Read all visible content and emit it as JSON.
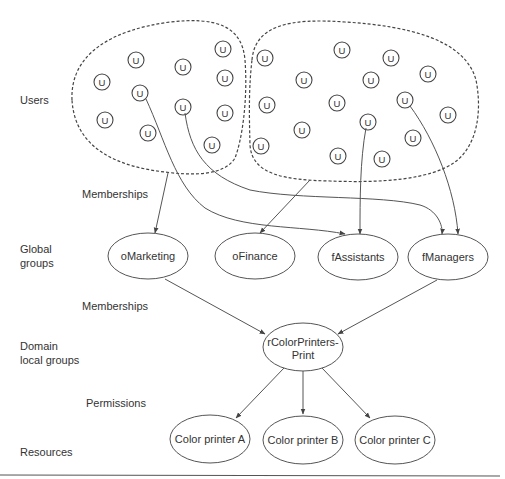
{
  "tiers": {
    "users": "Users",
    "memberships_1": "Memberships",
    "global_groups_line1": "Global",
    "global_groups_line2": "groups",
    "memberships_2": "Memberships",
    "domain_local_line1": "Domain",
    "domain_local_line2": "local groups",
    "permissions": "Permissions",
    "resources": "Resources"
  },
  "user_glyph": "U",
  "user_groups": [
    {
      "name": "left-user-set",
      "users": [
        [
          223,
          49
        ],
        [
          136,
          60
        ],
        [
          183,
          67
        ],
        [
          102,
          82
        ],
        [
          225,
          78
        ],
        [
          140,
          93
        ],
        [
          183,
          107
        ],
        [
          105,
          120
        ],
        [
          225,
          113
        ],
        [
          148,
          133
        ],
        [
          212,
          145
        ]
      ]
    },
    {
      "name": "right-user-set",
      "users": [
        [
          265,
          58
        ],
        [
          342,
          50
        ],
        [
          391,
          58
        ],
        [
          428,
          74
        ],
        [
          304,
          80
        ],
        [
          371,
          80
        ],
        [
          267,
          105
        ],
        [
          337,
          103
        ],
        [
          405,
          100
        ],
        [
          448,
          115
        ],
        [
          368,
          122
        ],
        [
          302,
          130
        ],
        [
          413,
          138
        ],
        [
          261,
          146
        ],
        [
          338,
          156
        ],
        [
          382,
          159
        ]
      ]
    }
  ],
  "global_groups": [
    {
      "id": "oMarketing",
      "label": "oMarketing"
    },
    {
      "id": "oFinance",
      "label": "oFinance"
    },
    {
      "id": "fAssistants",
      "label": "fAssistants"
    },
    {
      "id": "fManagers",
      "label": "fManagers"
    }
  ],
  "domain_local_group": {
    "line1": "rColorPrinters-",
    "line2": "Print"
  },
  "resources": [
    {
      "id": "printer-a",
      "label": "Color printer A"
    },
    {
      "id": "printer-b",
      "label": "Color printer B"
    },
    {
      "id": "printer-c",
      "label": "Color printer C"
    }
  ],
  "colors": {
    "stroke": "#555555",
    "text": "#333333",
    "background": "#ffffff"
  }
}
